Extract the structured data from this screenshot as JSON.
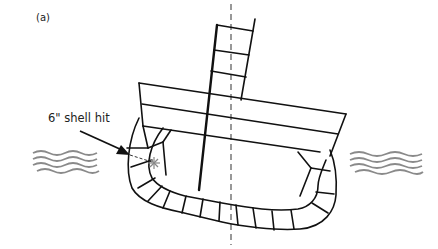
{
  "figure": {
    "panel_label": "(a)",
    "annotation": "6\" shell hit"
  },
  "colors": {
    "line": "#111111",
    "centerline": "#555555",
    "waves": "#8a8a8a",
    "burst": "#888888"
  }
}
